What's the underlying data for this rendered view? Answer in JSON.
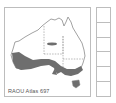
{
  "map": {
    "caption": "RAOU Atlas 697",
    "region": "Australia",
    "distribution_color": "#6e6e6e",
    "outline_color": "#8a8a8a"
  },
  "legend_grid": {
    "cell_count": 6
  }
}
